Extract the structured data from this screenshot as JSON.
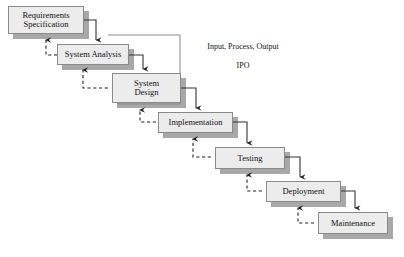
{
  "diagram": {
    "type": "waterfall-process-flow",
    "canvas": {
      "width": 404,
      "height": 257
    },
    "colors": {
      "box_fill": "#ececec",
      "box_border": "#8a8a8a",
      "shadow": "#a8a8a8",
      "line": "#333333",
      "feedback_line": "#222222",
      "background": "#ffffff",
      "text": "#111111"
    },
    "stages": [
      {
        "id": "requirements",
        "label": "Requirements\nSpecification",
        "x": 8,
        "y": 6,
        "w": 76,
        "h": 28
      },
      {
        "id": "analysis",
        "label": "System Analysis",
        "x": 57,
        "y": 44,
        "w": 72,
        "h": 21
      },
      {
        "id": "design",
        "label": "System\nDesign",
        "x": 112,
        "y": 73,
        "w": 69,
        "h": 30
      },
      {
        "id": "implementation",
        "label": "Implementation",
        "x": 158,
        "y": 112,
        "w": 75,
        "h": 21
      },
      {
        "id": "testing",
        "label": "Testing",
        "x": 215,
        "y": 147,
        "w": 70,
        "h": 22
      },
      {
        "id": "deployment",
        "label": "Deployment",
        "x": 266,
        "y": 181,
        "w": 75,
        "h": 21
      },
      {
        "id": "maintenance",
        "label": "Maintenance",
        "x": 318,
        "y": 212,
        "w": 70,
        "h": 22
      }
    ],
    "annotation": {
      "id": "ipo-note",
      "line1": "Input, Process, Output",
      "line2": "IPO",
      "x": 188,
      "y": 33,
      "w": 110
    },
    "forward_flow": [
      {
        "from": "requirements",
        "to": "analysis"
      },
      {
        "from": "analysis",
        "to": "design"
      },
      {
        "from": "design",
        "to": "implementation"
      },
      {
        "from": "implementation",
        "to": "testing"
      },
      {
        "from": "testing",
        "to": "deployment"
      },
      {
        "from": "deployment",
        "to": "maintenance"
      }
    ],
    "feedback_flow": [
      {
        "from": "analysis",
        "to": "requirements",
        "style": "dashed"
      },
      {
        "from": "design",
        "to": "analysis",
        "style": "dashed"
      },
      {
        "from": "implementation",
        "to": "design",
        "style": "dashed"
      },
      {
        "from": "testing",
        "to": "implementation",
        "style": "dashed"
      },
      {
        "from": "deployment",
        "to": "testing",
        "style": "dashed"
      },
      {
        "from": "maintenance",
        "to": "deployment",
        "style": "dashed"
      }
    ],
    "ipo_bracket": {
      "top_y": 35,
      "left_x": 108,
      "right_x": 180,
      "bottom_y": 104
    }
  }
}
